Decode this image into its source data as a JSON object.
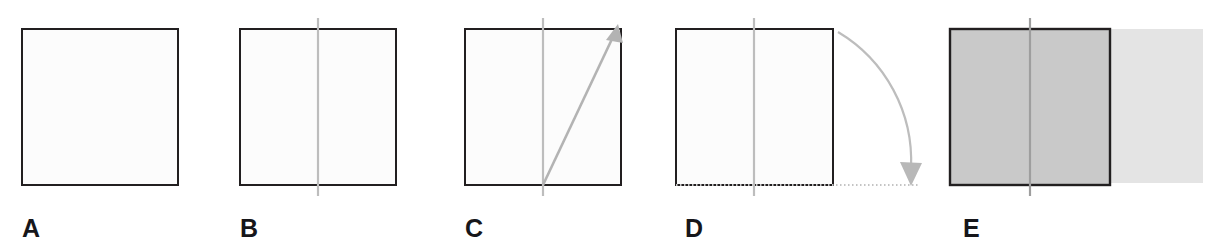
{
  "figure": {
    "background_color": "#ffffff",
    "width": 1218,
    "height": 249,
    "panel_count": 5
  },
  "style": {
    "outline_color": "#221f20",
    "outline_width": 2,
    "axis_color": "#bdbdbd",
    "arrow_color": "#b3b3b3",
    "dotted_color": "#c4c4c4",
    "square_fill": "#fcfcfc",
    "solid_fill": "#c9c9c9",
    "swept_fill": "#e2e2e2",
    "label_color": "#16161a"
  },
  "panels": [
    {
      "id": "a",
      "label": "A",
      "description": "plain square outline",
      "square": {
        "x": 22,
        "y": 29,
        "width": 156,
        "height": 156
      },
      "has_axis": false,
      "has_diagonal_arrow": false,
      "has_rotation_arc": false,
      "has_fill": false
    },
    {
      "id": "b",
      "label": "B",
      "description": "square with vertical axis of rotation",
      "square": {
        "x": 22,
        "y": 29,
        "width": 156,
        "height": 156
      },
      "axis": {
        "x": 100,
        "y_top": 18,
        "y_bottom": 196
      },
      "has_axis": true,
      "has_diagonal_arrow": false,
      "has_rotation_arc": false,
      "has_fill": false
    },
    {
      "id": "c",
      "label": "C",
      "description": "square with axis and diagonal arrow to upper right corner",
      "square": {
        "x": 25,
        "y": 29,
        "width": 156,
        "height": 156
      },
      "axis": {
        "x": 103,
        "y_top": 18,
        "y_bottom": 196
      },
      "arrow": {
        "x1": 103,
        "y1": 185,
        "x2": 178,
        "y2": 27
      },
      "has_axis": true,
      "has_diagonal_arrow": true,
      "has_rotation_arc": false,
      "has_fill": false
    },
    {
      "id": "d",
      "label": "D",
      "description": "square with axis, curved rotation arrow sweeping from top-right corner down to horizontal dotted baseline",
      "square": {
        "x": 8,
        "y": 29,
        "width": 157,
        "height": 156
      },
      "axis": {
        "x": 86,
        "y_top": 18,
        "y_bottom": 196
      },
      "arc": {
        "start_x": 170,
        "start_y": 32,
        "end_x": 244,
        "end_y": 176,
        "radius": 150
      },
      "dotted_baseline": {
        "x1": 8,
        "y": 185,
        "x2": 250
      },
      "has_axis": true,
      "has_diagonal_arrow": false,
      "has_rotation_arc": true,
      "has_fill": false
    },
    {
      "id": "e",
      "label": "E",
      "description": "shaded square plus lighter swept region extending to the right",
      "square": {
        "x": 14,
        "y": 29,
        "width": 160,
        "height": 156
      },
      "axis": {
        "x": 94,
        "y_top": 18,
        "y_bottom": 196
      },
      "swept": {
        "x": 174,
        "y": 29,
        "width": 93,
        "height": 154
      },
      "has_axis": true,
      "has_diagonal_arrow": false,
      "has_rotation_arc": false,
      "has_fill": true
    }
  ]
}
